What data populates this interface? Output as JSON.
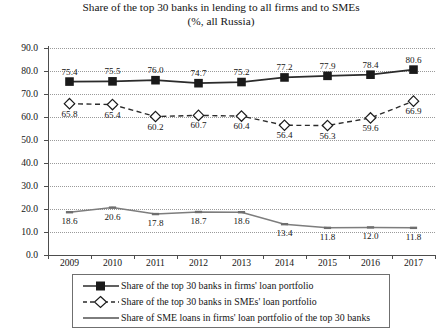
{
  "chart_data": {
    "type": "line",
    "title": "Share of the top 30 banks in lending to all firms and to SMEs",
    "subtitle": "(%, all Russia)",
    "xlabel": "",
    "ylabel": "",
    "categories": [
      "2009",
      "2010",
      "2011",
      "2012",
      "2013",
      "2014",
      "2015",
      "2016",
      "2017"
    ],
    "ylim": [
      0.0,
      90.0
    ],
    "ytick_labels": [
      "0.0",
      "10.0",
      "20.0",
      "30.0",
      "40.0",
      "50.0",
      "60.0",
      "70.0",
      "80.0",
      "90.0"
    ],
    "ytick_values": [
      0,
      10,
      20,
      30,
      40,
      50,
      60,
      70,
      80,
      90
    ],
    "grid": true,
    "grid_style": "dotted-horizontal",
    "legend_position": "bottom",
    "series": [
      {
        "name": "Share of the top 30 banks in firms' loan portfolio",
        "marker": "filled-square",
        "line_style": "solid",
        "color": "#2b2b2b",
        "values": [
          75.4,
          75.5,
          76.0,
          74.7,
          75.2,
          77.2,
          77.9,
          78.4,
          80.6
        ],
        "labels": [
          "75.4",
          "75.5",
          "76.0",
          "74.7",
          "75.2",
          "77.2",
          "77.9",
          "78.4",
          "80.6"
        ]
      },
      {
        "name": "Share of the top 30 banks in SMEs' loan portfolio",
        "marker": "open-diamond",
        "line_style": "dashed",
        "color": "#2b2b2b",
        "values": [
          65.8,
          65.4,
          60.2,
          60.7,
          60.4,
          56.4,
          56.3,
          59.6,
          66.9
        ],
        "labels": [
          "65.8",
          "65.4",
          "60.2",
          "60.7",
          "60.4",
          "56.4",
          "56.3",
          "59.6",
          "66.9"
        ]
      },
      {
        "name": "Share of SME loans in firms' loan portfolio of the top 30 banks",
        "marker": "small-dash",
        "line_style": "solid-thin",
        "color": "#7d7d7d",
        "values": [
          18.6,
          20.6,
          17.8,
          18.7,
          18.6,
          13.4,
          11.8,
          12.0,
          11.8
        ],
        "labels": [
          "18.6",
          "20.6",
          "17.8",
          "18.7",
          "18.6",
          "13.4",
          "11.8",
          "12.0",
          "11.8"
        ]
      }
    ]
  }
}
